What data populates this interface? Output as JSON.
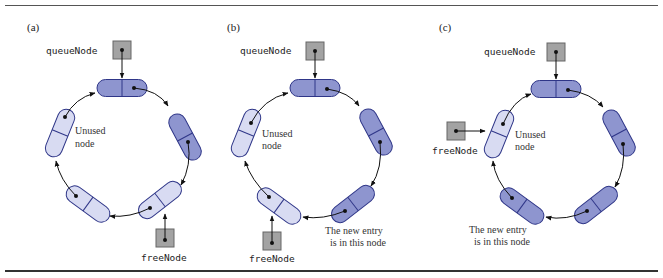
{
  "figure": {
    "panels": [
      {
        "id": "a",
        "label": "(a)",
        "queue_pointer_label": "queueNode",
        "free_pointer_label": "freeNode",
        "unused_label_line1": "Unused",
        "unused_label_line2": "node",
        "new_entry_line1": "",
        "new_entry_line2": "",
        "free_position": "lower-right",
        "node_states": [
          "used",
          "used",
          "free",
          "free",
          "free"
        ]
      },
      {
        "id": "b",
        "label": "(b)",
        "queue_pointer_label": "queueNode",
        "free_pointer_label": "freeNode",
        "unused_label_line1": "Unused",
        "unused_label_line2": "node",
        "new_entry_line1": "The new entry",
        "new_entry_line2": "is in this node",
        "free_position": "lower-left",
        "node_states": [
          "used",
          "used",
          "used",
          "free",
          "free"
        ]
      },
      {
        "id": "c",
        "label": "(c)",
        "queue_pointer_label": "queueNode",
        "free_pointer_label": "freeNode",
        "unused_label_line1": "Unused",
        "unused_label_line2": "node",
        "new_entry_line1": "The new entry",
        "new_entry_line2": "is in this node",
        "free_position": "upper-left",
        "node_states": [
          "used",
          "used",
          "used",
          "used",
          "free"
        ]
      }
    ],
    "colors": {
      "used_node_fill": "#8e95cf",
      "free_node_fill": "#d8dbf2",
      "node_stroke": "#2f3688",
      "pointer_box_fill": "#a3a3a3",
      "pointer_box_stroke": "#666666",
      "arrow": "#111111",
      "rule": "#444444"
    }
  }
}
